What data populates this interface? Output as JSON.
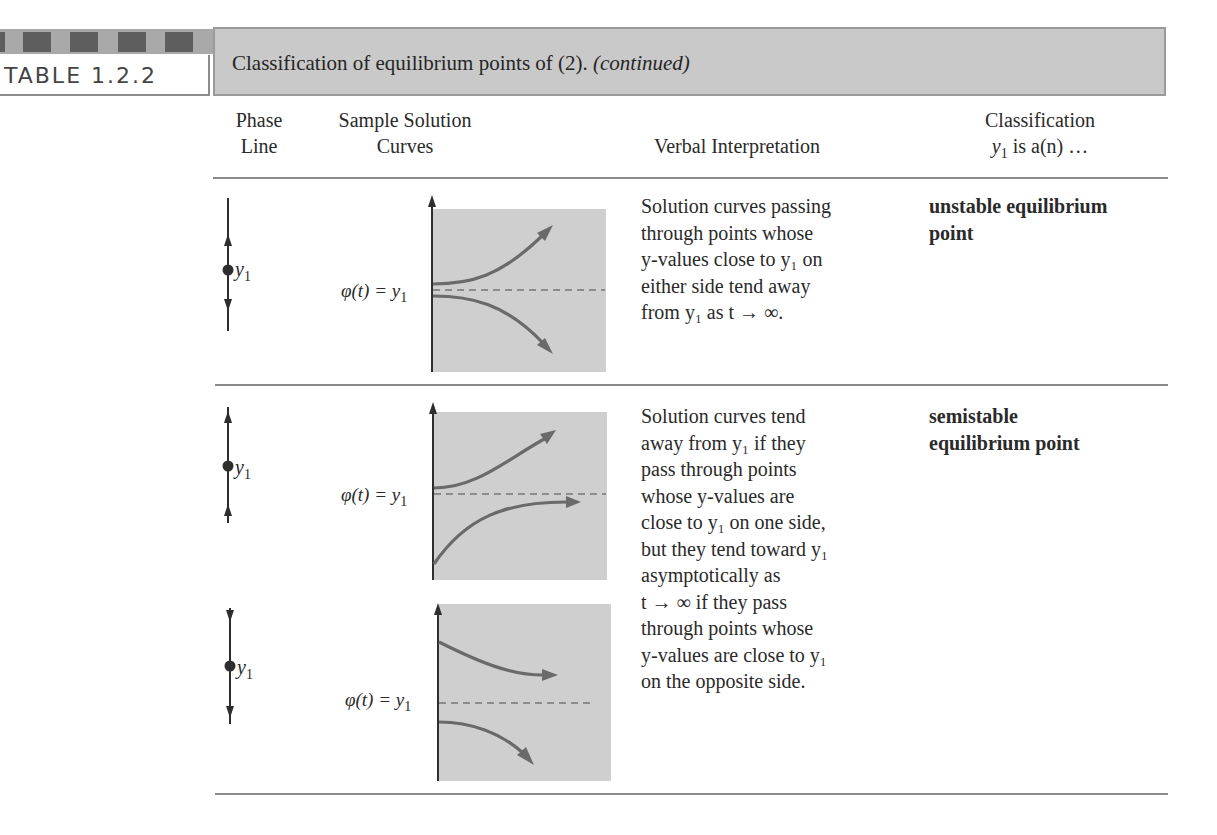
{
  "table": {
    "label": "TABLE 1.2.2",
    "caption": "Classification of equilibrium points of (2).",
    "caption_suffix": "(continued)"
  },
  "columns": {
    "phase_line": [
      "Phase",
      "Line"
    ],
    "sample_curves": [
      "Sample Solution",
      "Curves"
    ],
    "verbal": "Verbal Interpretation",
    "classification": [
      "Classification",
      "y",
      "1",
      " is a(n) …"
    ]
  },
  "common": {
    "y_label": "y",
    "y_sub": "1",
    "phi_label": "φ(t) = y",
    "phi_sub": "1"
  },
  "rows": [
    {
      "phase_arrows": "up-above, down-below",
      "verbal_lines": [
        "Solution curves passing",
        "through points whose",
        "y-values close to y₁ on",
        "either side tend away",
        "from y₁ as t → ∞."
      ],
      "classification_lines": [
        "unstable equilibrium",
        "point"
      ]
    },
    {
      "phase_arrows_a": "up-above, up-below",
      "phase_arrows_b": "down-above, down-below",
      "verbal_lines": [
        "Solution curves tend",
        "away from y₁ if they",
        "pass through points",
        "whose y-values are",
        "close to y₁ on one side,",
        "but they tend toward y₁",
        "asymptotically as",
        "t → ∞ if they pass",
        "through points whose",
        "y-values are close to y₁",
        "on the opposite side."
      ],
      "classification_lines": [
        "semistable",
        "equilibrium point"
      ]
    }
  ],
  "colors": {
    "plot_fill": "#cfcfcf",
    "curve": "#6a6a6a",
    "caption_bar": "#c9c9c9",
    "strip_dark": "#5e5e5e",
    "strip_light": "#a9a9a9"
  }
}
